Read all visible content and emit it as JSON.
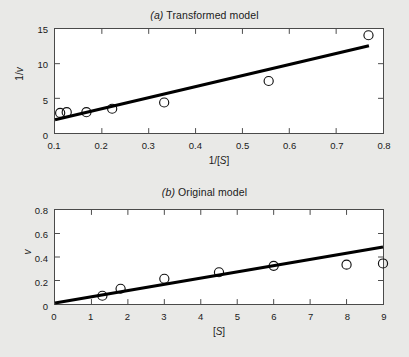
{
  "figure": {
    "background_color": "#e9e9e7",
    "panel_background": "#ffffff",
    "line_color": "#000000",
    "marker_color": "#111111"
  },
  "panel_a": {
    "title_index": "(a)",
    "title_text": " Transformed model",
    "xlabel_parts": {
      "pre": "1/[",
      "sym": "S",
      "post": "]"
    },
    "ylabel_parts": {
      "pre": "1/",
      "sym": "v",
      "post": ""
    },
    "xticks": [
      "0.1",
      "0.2",
      "0.3",
      "0.4",
      "0.5",
      "0.6",
      "0.7",
      "0.8"
    ],
    "yticks": [
      "0",
      "5",
      "10",
      "15"
    ]
  },
  "panel_b": {
    "title_index": "(b)",
    "title_text": " Original model",
    "xlabel_parts": {
      "pre": "[",
      "sym": "S",
      "post": "]"
    },
    "ylabel_parts": {
      "pre": "",
      "sym": "v",
      "post": ""
    },
    "xticks": [
      "0",
      "1",
      "2",
      "3",
      "4",
      "5",
      "6",
      "7",
      "8",
      "9"
    ],
    "yticks": [
      "0",
      "0.2",
      "0.4",
      "0.6",
      "0.8"
    ]
  },
  "chart_data": [
    {
      "id": "panel-a",
      "type": "scatter",
      "title": "(a) Transformed model",
      "xlabel": "1/[S]",
      "ylabel": "1/v",
      "xlim": [
        0.1,
        0.8
      ],
      "ylim": [
        0,
        15
      ],
      "xticks": [
        0.1,
        0.2,
        0.3,
        0.4,
        0.5,
        0.6,
        0.7,
        0.8
      ],
      "yticks": [
        0,
        5,
        10,
        15
      ],
      "grid": false,
      "legend": "none",
      "series": [
        {
          "name": "observations",
          "marker": "open-circle",
          "x": [
            0.111,
            0.125,
            0.167,
            0.222,
            0.333,
            0.556,
            0.769
          ],
          "y": [
            2.9,
            3.0,
            3.0,
            3.5,
            4.4,
            7.5,
            14.1
          ]
        },
        {
          "name": "linear fit",
          "type": "line",
          "x": [
            0.1,
            0.77
          ],
          "y": [
            1.9,
            12.6
          ]
        }
      ]
    },
    {
      "id": "panel-b",
      "type": "scatter",
      "title": "(b) Original model",
      "xlabel": "[S]",
      "ylabel": "v",
      "xlim": [
        0,
        9
      ],
      "ylim": [
        0,
        0.8
      ],
      "xticks": [
        0,
        1,
        2,
        3,
        4,
        5,
        6,
        7,
        8,
        9
      ],
      "yticks": [
        0,
        0.2,
        0.4,
        0.6,
        0.8
      ],
      "grid": false,
      "legend": "none",
      "series": [
        {
          "name": "observations",
          "marker": "open-circle",
          "x": [
            1.3,
            1.8,
            3.0,
            4.5,
            6.0,
            8.0,
            9.0
          ],
          "y": [
            0.07,
            0.13,
            0.215,
            0.27,
            0.325,
            0.335,
            0.345
          ]
        },
        {
          "name": "model fit",
          "type": "line",
          "x": [
            0,
            9
          ],
          "y": [
            0.008,
            0.485
          ]
        }
      ]
    }
  ]
}
